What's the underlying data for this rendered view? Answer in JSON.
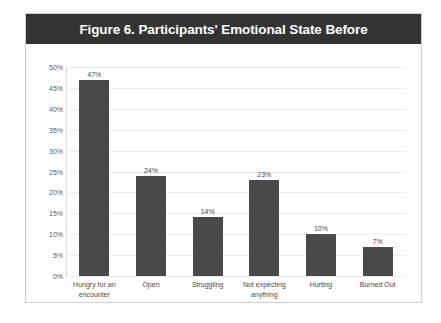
{
  "figure": {
    "title": "Figure 6. Participants' Emotional State Before",
    "title_bar_color": "#333333",
    "title_text_color": "#ffffff",
    "frame_border_color": "#d0d0d0",
    "background_color": "#ffffff"
  },
  "chart_data": {
    "type": "bar",
    "title": "Figure 6. Participants' Emotional State Before",
    "xlabel": "",
    "ylabel": "",
    "categories": [
      "Hungry for an encounter",
      "Open",
      "Struggling",
      "Not expecting anything",
      "Hurting",
      "Burned Out"
    ],
    "values": [
      47,
      24,
      14,
      23,
      10,
      7
    ],
    "data_labels": [
      "47%",
      "24%",
      "14%",
      "23%",
      "10%",
      "7%"
    ],
    "ylim": [
      0,
      50
    ],
    "ytick_values": [
      0,
      5,
      10,
      15,
      20,
      25,
      30,
      35,
      40,
      45,
      50
    ],
    "ytick_labels": [
      "0%",
      "5%",
      "10%",
      "15%",
      "20%",
      "25%",
      "30%",
      "35%",
      "40%",
      "45%",
      "50%"
    ],
    "grid": true,
    "grid_axis": "y",
    "grid_color": "#ededed",
    "legend": false,
    "bar_color": "#4a4a4a",
    "unit": "%"
  }
}
